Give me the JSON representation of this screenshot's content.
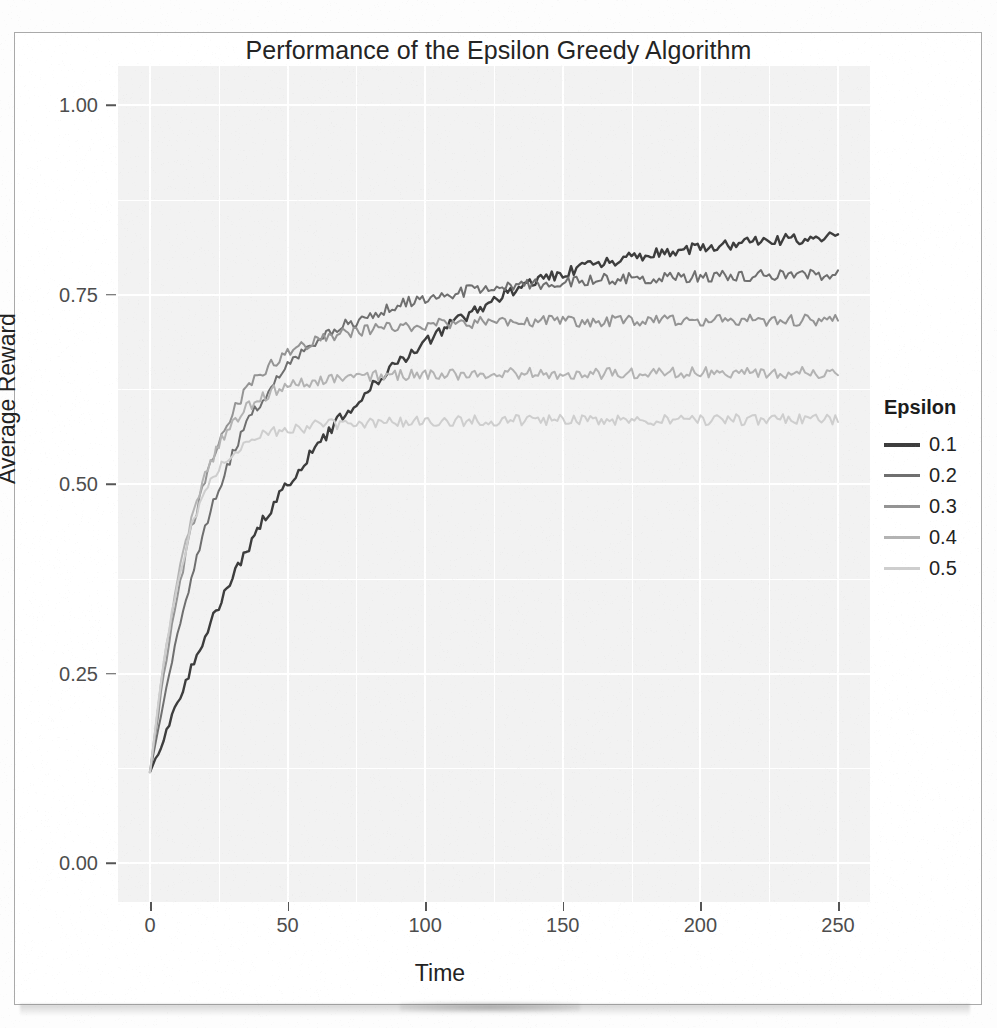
{
  "figure": {
    "title": "Performance of the Epsilon Greedy Algorithm"
  },
  "legend": {
    "title": "Epsilon",
    "entries": [
      {
        "label": "0.1",
        "color": "#3d3d3d"
      },
      {
        "label": "0.2",
        "color": "#6f6f6f"
      },
      {
        "label": "0.3",
        "color": "#949494"
      },
      {
        "label": "0.4",
        "color": "#b3b3b3"
      },
      {
        "label": "0.5",
        "color": "#cecece"
      }
    ]
  },
  "chart_data": {
    "type": "line",
    "title": "Performance of the Epsilon Greedy Algorithm",
    "xlabel": "Time",
    "ylabel": "Average Reward",
    "xlim": [
      0,
      250
    ],
    "ylim": [
      0.0,
      1.0
    ],
    "xticks": [
      0,
      50,
      100,
      150,
      200,
      250
    ],
    "xtick_labels": [
      "0",
      "50",
      "100",
      "150",
      "200",
      "250"
    ],
    "yticks": [
      0.0,
      0.25,
      0.5,
      0.75,
      1.0
    ],
    "ytick_labels": [
      "0.00",
      "0.25",
      "0.50",
      "0.75",
      "1.00"
    ],
    "grid": true,
    "legend_title": "Epsilon",
    "legend_position": "right",
    "panel_background": "#f2f2f2",
    "x": [
      0,
      5,
      10,
      15,
      20,
      25,
      30,
      35,
      40,
      45,
      50,
      60,
      70,
      80,
      90,
      100,
      110,
      120,
      130,
      140,
      150,
      160,
      170,
      180,
      190,
      200,
      210,
      220,
      230,
      240,
      250
    ],
    "series": [
      {
        "name": "0.1",
        "color": "#3d3d3d",
        "values": [
          0.12,
          0.165,
          0.212,
          0.258,
          0.3,
          0.34,
          0.378,
          0.412,
          0.445,
          0.474,
          0.5,
          0.548,
          0.59,
          0.628,
          0.66,
          0.688,
          0.712,
          0.733,
          0.752,
          0.767,
          0.778,
          0.788,
          0.795,
          0.802,
          0.807,
          0.812,
          0.816,
          0.819,
          0.822,
          0.824,
          0.826
        ]
      },
      {
        "name": "0.2",
        "color": "#6f6f6f",
        "values": [
          0.12,
          0.215,
          0.3,
          0.375,
          0.44,
          0.495,
          0.54,
          0.578,
          0.608,
          0.633,
          0.654,
          0.686,
          0.708,
          0.724,
          0.736,
          0.745,
          0.752,
          0.757,
          0.761,
          0.764,
          0.767,
          0.769,
          0.771,
          0.772,
          0.773,
          0.774,
          0.775,
          0.775,
          0.776,
          0.776,
          0.777
        ]
      },
      {
        "name": "0.3",
        "color": "#949494",
        "values": [
          0.12,
          0.248,
          0.355,
          0.44,
          0.505,
          0.555,
          0.594,
          0.623,
          0.645,
          0.661,
          0.673,
          0.689,
          0.699,
          0.704,
          0.708,
          0.71,
          0.712,
          0.713,
          0.714,
          0.714,
          0.715,
          0.715,
          0.715,
          0.716,
          0.716,
          0.716,
          0.716,
          0.716,
          0.716,
          0.716,
          0.716
        ]
      },
      {
        "name": "0.4",
        "color": "#b3b3b3",
        "values": [
          0.12,
          0.265,
          0.375,
          0.455,
          0.512,
          0.552,
          0.58,
          0.6,
          0.613,
          0.623,
          0.629,
          0.636,
          0.64,
          0.642,
          0.643,
          0.644,
          0.645,
          0.645,
          0.646,
          0.646,
          0.646,
          0.646,
          0.646,
          0.647,
          0.647,
          0.647,
          0.647,
          0.647,
          0.647,
          0.647,
          0.647
        ]
      },
      {
        "name": "0.5",
        "color": "#cecece",
        "values": [
          0.12,
          0.268,
          0.372,
          0.442,
          0.489,
          0.52,
          0.54,
          0.553,
          0.562,
          0.568,
          0.572,
          0.577,
          0.58,
          0.581,
          0.582,
          0.583,
          0.583,
          0.584,
          0.584,
          0.584,
          0.584,
          0.585,
          0.585,
          0.585,
          0.585,
          0.585,
          0.585,
          0.585,
          0.585,
          0.585,
          0.585
        ]
      }
    ]
  }
}
